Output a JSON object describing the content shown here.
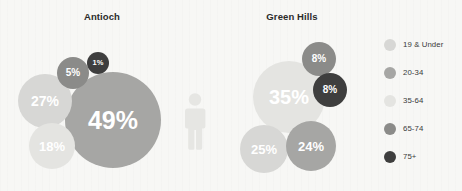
{
  "background_color": "#f7f7f5",
  "palette": {
    "19_under": "#d7d7d5",
    "20_34": "#a6a6a4",
    "35_64": "#e4e4e1",
    "65_74": "#8b8b89",
    "75_plus": "#3e3e3e",
    "person_icon": "#e6e6e3",
    "title_color": "#2b2b2b",
    "label_color": "#3a3a3a"
  },
  "chart_data": {
    "type": "bubble",
    "title": "",
    "legend_position": "right",
    "legend": [
      {
        "label": "19 & Under",
        "color": "#d7d7d5"
      },
      {
        "label": "20-34",
        "color": "#a6a6a4"
      },
      {
        "label": "35-64",
        "color": "#e4e4e1"
      },
      {
        "label": "65-74",
        "color": "#8b8b89"
      },
      {
        "label": "75+",
        "color": "#3e3e3e"
      }
    ],
    "groups": [
      {
        "name": "Antioch",
        "bubbles": [
          {
            "label": "49%",
            "value": 49,
            "category": "20-34",
            "color": "#a6a6a4",
            "cx": 113,
            "cy": 120,
            "r": 48,
            "font": 25
          },
          {
            "label": "27%",
            "value": 27,
            "category": "19 & Under",
            "color": "#d7d7d5",
            "cx": 45,
            "cy": 101,
            "r": 27,
            "font": 14
          },
          {
            "label": "18%",
            "value": 18,
            "category": "35-64",
            "color": "#e4e4e1",
            "cx": 52,
            "cy": 146,
            "r": 23,
            "font": 13
          },
          {
            "label": "5%",
            "value": 5,
            "category": "65-74",
            "color": "#8b8b89",
            "cx": 73,
            "cy": 73,
            "r": 16,
            "font": 10
          },
          {
            "label": "1%",
            "value": 1,
            "category": "75+",
            "color": "#3e3e3e",
            "cx": 98,
            "cy": 63,
            "r": 11,
            "font": 7.5
          }
        ]
      },
      {
        "name": "Green Hills",
        "bubbles": [
          {
            "label": "35%",
            "value": 35,
            "category": "35-64",
            "color": "#e4e4e1",
            "cx": 289,
            "cy": 97,
            "r": 36,
            "font": 20
          },
          {
            "label": "25%",
            "value": 25,
            "category": "19 & Under",
            "color": "#d7d7d5",
            "cx": 264,
            "cy": 149,
            "r": 24,
            "font": 13
          },
          {
            "label": "24%",
            "value": 24,
            "category": "20-34",
            "color": "#a6a6a4",
            "cx": 311,
            "cy": 146,
            "r": 25,
            "font": 13
          },
          {
            "label": "8%",
            "value": 8,
            "category": "65-74",
            "color": "#8b8b89",
            "cx": 319,
            "cy": 59,
            "r": 17,
            "font": 10
          },
          {
            "label": "8%",
            "value": 8,
            "category": "75+",
            "color": "#3e3e3e",
            "cx": 330,
            "cy": 90,
            "r": 17,
            "font": 10
          }
        ]
      }
    ]
  },
  "icons": {
    "person": "person-icon"
  }
}
